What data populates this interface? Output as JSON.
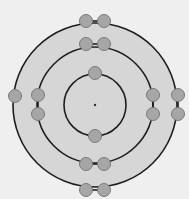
{
  "diagram": {
    "colors": {
      "background": "#efefef",
      "disk_fill": "#d6d6d6",
      "orbit_stroke": "#1e1e1e",
      "electron_fill": "#a6a6a6",
      "electron_stroke": "#7a7a7a",
      "nucleus": "#333333"
    },
    "nucleus": {
      "cx": 95,
      "cy": 105,
      "r": 1.2
    },
    "orbits": [
      {
        "name": "shell-1",
        "r": 31,
        "electron_count": 2
      },
      {
        "name": "shell-2",
        "r": 58,
        "electron_count": 8
      },
      {
        "name": "shell-3",
        "r": 82,
        "electron_count": 6
      }
    ],
    "electrons": [
      {
        "shell": 1,
        "cx": 95,
        "cy": 73
      },
      {
        "shell": 1,
        "cx": 95,
        "cy": 136
      },
      {
        "shell": 2,
        "cx": 86,
        "cy": 44
      },
      {
        "shell": 2,
        "cx": 104,
        "cy": 44
      },
      {
        "shell": 2,
        "cx": 38,
        "cy": 95
      },
      {
        "shell": 2,
        "cx": 38,
        "cy": 114
      },
      {
        "shell": 2,
        "cx": 153,
        "cy": 95
      },
      {
        "shell": 2,
        "cx": 153,
        "cy": 114
      },
      {
        "shell": 2,
        "cx": 86,
        "cy": 164
      },
      {
        "shell": 2,
        "cx": 104,
        "cy": 164
      },
      {
        "shell": 3,
        "cx": 86,
        "cy": 21
      },
      {
        "shell": 3,
        "cx": 104,
        "cy": 21
      },
      {
        "shell": 3,
        "cx": 15,
        "cy": 96
      },
      {
        "shell": 3,
        "cx": 178,
        "cy": 95
      },
      {
        "shell": 3,
        "cx": 178,
        "cy": 114
      },
      {
        "shell": 3,
        "cx": 86,
        "cy": 190
      },
      {
        "shell": 3,
        "cx": 104,
        "cy": 190
      }
    ],
    "electron_radius": 6.5,
    "pair_links": [
      [
        86,
        21,
        104,
        21
      ],
      [
        86,
        44,
        104,
        44
      ],
      [
        86,
        164,
        104,
        164
      ],
      [
        86,
        190,
        104,
        190
      ],
      [
        38,
        95,
        38,
        114
      ],
      [
        153,
        95,
        153,
        114
      ],
      [
        178,
        95,
        178,
        114
      ]
    ]
  }
}
